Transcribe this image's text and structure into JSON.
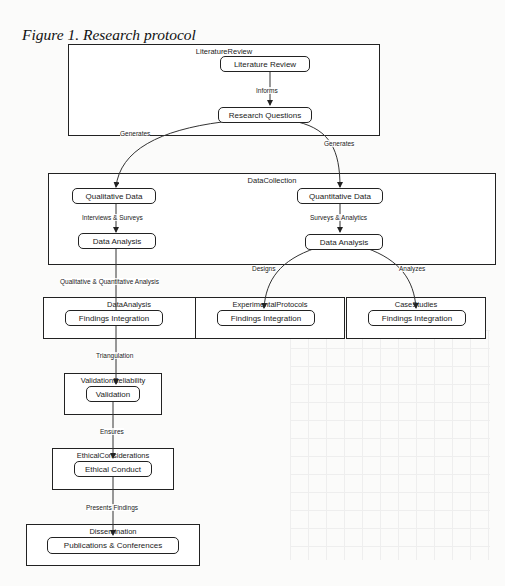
{
  "figure": {
    "title": "Figure 1. Research protocol"
  },
  "clusters": {
    "literature_review": "LiteratureReview",
    "data_collection": "DataCollection",
    "data_analysis": "DataAnalysis",
    "experimental_protocols": "ExperimentalProtocols",
    "case_studies": "CaseStudies",
    "validation_reliability": "ValidationReliability",
    "ethical_considerations": "EthicalConsiderations",
    "dissemination": "Dissemination"
  },
  "nodes": {
    "literature_review": "Literature Review",
    "research_questions": "Research Questions",
    "qualitative_data": "Qualitative Data",
    "quantitative_data": "Quantitative Data",
    "qual_data_analysis": "Data Analysis",
    "quant_data_analysis": "Data Analysis",
    "findings_integration_1": "Findings Integration",
    "findings_integration_2": "Findings Integration",
    "findings_integration_3": "Findings Integration",
    "validation": "Validation",
    "ethical_conduct": "Ethical Conduct",
    "publications": "Publications & Conferences"
  },
  "edges": {
    "informs": "Informs",
    "generates_left": "Generates",
    "generates_right": "Generates",
    "interviews_surveys": "Interviews & Surveys",
    "surveys_analytics": "Surveys & Analytics",
    "qual_quant_analysis": "Qualitative & Quantitative Analysis",
    "designs": "Designs",
    "analyzes": "Analyzes",
    "triangulation": "Triangulation",
    "ensures": "Ensures",
    "presents_findings": "Presents Findings"
  }
}
